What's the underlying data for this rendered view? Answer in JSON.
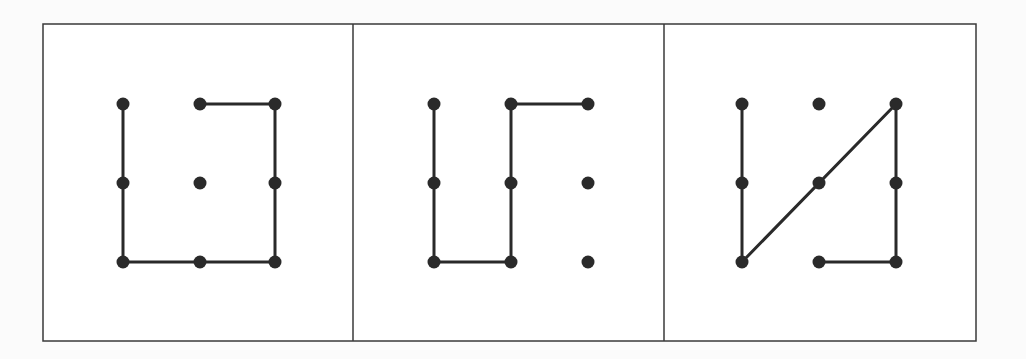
{
  "colors": {
    "background": "#fbfbfb",
    "panel_fill": "#ffffff",
    "ink": "#2a2a2a",
    "border": "#3a3a3a"
  },
  "frame": {
    "x": 43,
    "y": 24,
    "width": 933,
    "height": 317,
    "dividers_x": [
      353,
      664
    ]
  },
  "grid": {
    "rows": 3,
    "cols": 3,
    "dot_radius": 6.5,
    "line_width": 3
  },
  "panels": [
    {
      "id": "panel-1",
      "grid_x": [
        123,
        200,
        275
      ],
      "grid_y": [
        104,
        183,
        262
      ],
      "dots": [
        [
          0,
          0
        ],
        [
          1,
          0
        ],
        [
          2,
          0
        ],
        [
          0,
          1
        ],
        [
          1,
          1
        ],
        [
          2,
          1
        ],
        [
          0,
          2
        ],
        [
          1,
          2
        ],
        [
          2,
          2
        ]
      ],
      "segments": [
        [
          [
            0,
            0
          ],
          [
            0,
            2
          ]
        ],
        [
          [
            0,
            2
          ],
          [
            2,
            2
          ]
        ],
        [
          [
            2,
            2
          ],
          [
            2,
            0
          ]
        ],
        [
          [
            2,
            0
          ],
          [
            1,
            0
          ]
        ]
      ]
    },
    {
      "id": "panel-2",
      "grid_x": [
        434,
        511,
        588
      ],
      "grid_y": [
        104,
        183,
        262
      ],
      "dots": [
        [
          0,
          0
        ],
        [
          1,
          0
        ],
        [
          2,
          0
        ],
        [
          0,
          1
        ],
        [
          1,
          1
        ],
        [
          2,
          1
        ],
        [
          0,
          2
        ],
        [
          1,
          2
        ],
        [
          2,
          2
        ]
      ],
      "segments": [
        [
          [
            0,
            0
          ],
          [
            0,
            2
          ]
        ],
        [
          [
            0,
            2
          ],
          [
            1,
            2
          ]
        ],
        [
          [
            1,
            2
          ],
          [
            1,
            0
          ]
        ],
        [
          [
            1,
            0
          ],
          [
            2,
            0
          ]
        ]
      ]
    },
    {
      "id": "panel-3",
      "grid_x": [
        742,
        819,
        896
      ],
      "grid_y": [
        104,
        183,
        262
      ],
      "dots": [
        [
          0,
          0
        ],
        [
          1,
          0
        ],
        [
          2,
          0
        ],
        [
          0,
          1
        ],
        [
          1,
          1
        ],
        [
          2,
          1
        ],
        [
          0,
          2
        ],
        [
          1,
          2
        ],
        [
          2,
          2
        ]
      ],
      "segments": [
        [
          [
            0,
            0
          ],
          [
            0,
            2
          ]
        ],
        [
          [
            0,
            2
          ],
          [
            2,
            0
          ]
        ],
        [
          [
            2,
            0
          ],
          [
            2,
            2
          ]
        ],
        [
          [
            2,
            2
          ],
          [
            1,
            2
          ]
        ]
      ]
    }
  ]
}
